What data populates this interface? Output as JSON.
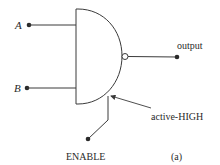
{
  "diagram": {
    "type": "logic-gate",
    "gate": "NAND with enable",
    "inputs": [
      {
        "id": "A",
        "label": "A"
      },
      {
        "id": "B",
        "label": "B"
      }
    ],
    "output": {
      "label": "output"
    },
    "enable": {
      "label": "ENABLE",
      "annotation": "active-HIGH"
    },
    "caption": "(a)",
    "colors": {
      "line": "#3a3a3a",
      "text": "#2a2a2a",
      "background": "#ffffff"
    }
  }
}
